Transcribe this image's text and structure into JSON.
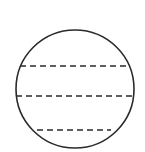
{
  "diagram": {
    "type": "circle-with-chords",
    "colors": {
      "stroke": "#2a2a2a",
      "background": "#ffffff"
    },
    "circle": {
      "cx": 75,
      "cy": 89,
      "r": 59
    },
    "chords": [
      {
        "y": 66,
        "x1": 20,
        "x2": 129,
        "style": "dashed"
      },
      {
        "y": 96,
        "x1": 16,
        "x2": 133,
        "style": "dashed"
      },
      {
        "y": 130,
        "x1": 37,
        "x2": 111,
        "style": "dashed"
      }
    ]
  }
}
